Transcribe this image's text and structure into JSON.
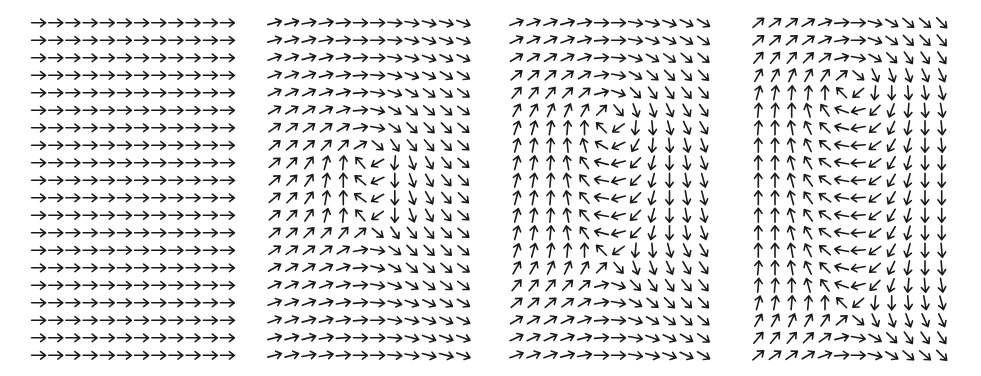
{
  "figure": {
    "arrow_color": "#1a1a1a",
    "background": "#ffffff",
    "rows": 20,
    "cols": 12
  },
  "panels": [
    {
      "id": "panel-1",
      "x": 30,
      "width": 206,
      "angles": [
        [
          0,
          0,
          0,
          0,
          0,
          0,
          0,
          0,
          0,
          0,
          0,
          0
        ],
        [
          0,
          0,
          0,
          0,
          0,
          0,
          0,
          0,
          0,
          0,
          0,
          0
        ],
        [
          0,
          0,
          0,
          0,
          0,
          0,
          0,
          0,
          0,
          0,
          0,
          0
        ],
        [
          0,
          0,
          0,
          0,
          0,
          0,
          0,
          0,
          0,
          0,
          0,
          0
        ],
        [
          0,
          0,
          0,
          0,
          0,
          0,
          0,
          0,
          0,
          0,
          0,
          0
        ],
        [
          0,
          0,
          0,
          0,
          0,
          0,
          0,
          0,
          0,
          0,
          0,
          0
        ],
        [
          0,
          0,
          0,
          0,
          0,
          0,
          0,
          0,
          0,
          0,
          0,
          0
        ],
        [
          0,
          0,
          0,
          0,
          0,
          0,
          0,
          0,
          0,
          0,
          0,
          0
        ],
        [
          0,
          0,
          0,
          0,
          0,
          0,
          0,
          0,
          0,
          0,
          0,
          0
        ],
        [
          0,
          0,
          0,
          0,
          0,
          0,
          0,
          0,
          0,
          0,
          0,
          0
        ],
        [
          0,
          0,
          0,
          0,
          0,
          0,
          0,
          0,
          0,
          0,
          0,
          0
        ],
        [
          0,
          0,
          0,
          0,
          0,
          0,
          0,
          0,
          0,
          0,
          0,
          0
        ],
        [
          0,
          0,
          0,
          0,
          0,
          0,
          0,
          0,
          0,
          0,
          0,
          0
        ],
        [
          0,
          0,
          0,
          0,
          0,
          0,
          0,
          0,
          0,
          0,
          0,
          0
        ],
        [
          0,
          0,
          0,
          0,
          0,
          0,
          0,
          0,
          0,
          0,
          0,
          0
        ],
        [
          0,
          0,
          0,
          0,
          0,
          0,
          0,
          0,
          0,
          0,
          0,
          0
        ],
        [
          0,
          0,
          0,
          0,
          0,
          0,
          0,
          0,
          0,
          0,
          0,
          0
        ],
        [
          0,
          0,
          0,
          0,
          0,
          0,
          0,
          0,
          0,
          0,
          0,
          0
        ],
        [
          0,
          0,
          0,
          0,
          0,
          0,
          0,
          0,
          0,
          0,
          0,
          0
        ],
        [
          0,
          0,
          0,
          0,
          0,
          0,
          0,
          0,
          0,
          0,
          0,
          0
        ]
      ]
    },
    {
      "id": "panel-2",
      "x": 266,
      "width": 206,
      "angles": [
        [
          15,
          15,
          10,
          10,
          5,
          0,
          0,
          -5,
          -10,
          -15,
          -15,
          -20
        ],
        [
          15,
          15,
          15,
          10,
          5,
          0,
          0,
          -5,
          -15,
          -20,
          -20,
          -20
        ],
        [
          20,
          20,
          15,
          15,
          10,
          5,
          0,
          -10,
          -15,
          -20,
          -25,
          -25
        ],
        [
          20,
          20,
          20,
          15,
          10,
          5,
          -5,
          -15,
          -20,
          -25,
          -30,
          -30
        ],
        [
          25,
          25,
          25,
          20,
          15,
          5,
          -10,
          -20,
          -30,
          -35,
          -35,
          -35
        ],
        [
          30,
          30,
          30,
          25,
          20,
          5,
          -15,
          -30,
          -40,
          -40,
          -40,
          -35
        ],
        [
          35,
          35,
          35,
          35,
          30,
          10,
          -10,
          -35,
          -45,
          -45,
          -45,
          -40
        ],
        [
          40,
          40,
          40,
          45,
          45,
          30,
          -40,
          -55,
          -50,
          -50,
          -45,
          -40
        ],
        [
          40,
          45,
          55,
          75,
          85,
          130,
          210,
          265,
          290,
          300,
          310,
          320
        ],
        [
          40,
          45,
          55,
          80,
          90,
          140,
          205,
          270,
          290,
          300,
          310,
          315
        ],
        [
          40,
          45,
          55,
          80,
          90,
          145,
          210,
          270,
          290,
          300,
          310,
          315
        ],
        [
          40,
          45,
          55,
          75,
          85,
          130,
          215,
          270,
          290,
          300,
          310,
          320
        ],
        [
          40,
          40,
          45,
          45,
          50,
          40,
          -40,
          -55,
          -50,
          -50,
          -45,
          -40
        ],
        [
          35,
          35,
          35,
          35,
          30,
          10,
          -10,
          -35,
          -45,
          -45,
          -45,
          -40
        ],
        [
          30,
          30,
          30,
          25,
          20,
          5,
          -15,
          -30,
          -40,
          -40,
          -40,
          -35
        ],
        [
          25,
          25,
          25,
          20,
          15,
          5,
          -10,
          -20,
          -30,
          -35,
          -35,
          -35
        ],
        [
          20,
          20,
          20,
          15,
          10,
          5,
          -5,
          -15,
          -20,
          -25,
          -30,
          -30
        ],
        [
          20,
          20,
          15,
          15,
          10,
          5,
          0,
          -10,
          -15,
          -20,
          -25,
          -25
        ],
        [
          15,
          15,
          15,
          10,
          5,
          0,
          0,
          -5,
          -15,
          -20,
          -20,
          -20
        ],
        [
          15,
          15,
          10,
          10,
          5,
          0,
          0,
          -5,
          -10,
          -15,
          -15,
          -20
        ]
      ]
    },
    {
      "id": "panel-3",
      "x": 508,
      "width": 204,
      "angles": [
        [
          20,
          20,
          20,
          15,
          10,
          0,
          0,
          -10,
          -15,
          -20,
          -25,
          -30
        ],
        [
          25,
          25,
          25,
          20,
          15,
          5,
          0,
          -10,
          -20,
          -25,
          -30,
          -35
        ],
        [
          30,
          30,
          30,
          25,
          20,
          5,
          -5,
          -20,
          -30,
          -35,
          -40,
          -40
        ],
        [
          40,
          40,
          40,
          35,
          30,
          10,
          -10,
          -30,
          -40,
          -45,
          -45,
          -45
        ],
        [
          50,
          50,
          50,
          45,
          40,
          15,
          -20,
          -45,
          -55,
          -55,
          -50,
          -50
        ],
        [
          60,
          60,
          65,
          65,
          60,
          45,
          -50,
          -70,
          -70,
          -65,
          -60,
          -55
        ],
        [
          70,
          75,
          80,
          85,
          90,
          135,
          215,
          265,
          275,
          285,
          295,
          300
        ],
        [
          75,
          80,
          85,
          95,
          105,
          150,
          205,
          240,
          265,
          275,
          285,
          290
        ],
        [
          75,
          80,
          85,
          100,
          125,
          165,
          195,
          225,
          255,
          270,
          280,
          290
        ],
        [
          75,
          80,
          85,
          100,
          130,
          170,
          195,
          225,
          255,
          270,
          280,
          285
        ],
        [
          75,
          80,
          85,
          100,
          130,
          170,
          195,
          225,
          255,
          270,
          280,
          285
        ],
        [
          75,
          80,
          85,
          100,
          130,
          170,
          195,
          225,
          255,
          270,
          280,
          285
        ],
        [
          75,
          80,
          85,
          100,
          125,
          165,
          195,
          225,
          255,
          270,
          280,
          290
        ],
        [
          70,
          75,
          80,
          85,
          90,
          135,
          215,
          265,
          275,
          285,
          295,
          300
        ],
        [
          60,
          60,
          65,
          65,
          60,
          45,
          -50,
          -70,
          -70,
          -65,
          -60,
          -55
        ],
        [
          50,
          50,
          50,
          45,
          40,
          15,
          -20,
          -45,
          -55,
          -55,
          -50,
          -50
        ],
        [
          40,
          40,
          40,
          35,
          30,
          10,
          -10,
          -30,
          -40,
          -45,
          -45,
          -45
        ],
        [
          30,
          30,
          30,
          25,
          20,
          5,
          -5,
          -20,
          -30,
          -35,
          -40,
          -40
        ],
        [
          25,
          25,
          25,
          20,
          15,
          5,
          0,
          -10,
          -20,
          -25,
          -30,
          -35
        ],
        [
          20,
          20,
          20,
          15,
          10,
          0,
          0,
          -10,
          -15,
          -20,
          -25,
          -30
        ]
      ]
    },
    {
      "id": "panel-4",
      "x": 750,
      "width": 200,
      "angles": [
        [
          40,
          35,
          35,
          30,
          20,
          5,
          0,
          -15,
          -30,
          -40,
          -40,
          -45
        ],
        [
          40,
          40,
          40,
          35,
          25,
          10,
          0,
          -20,
          -35,
          -45,
          -45,
          -50
        ],
        [
          50,
          50,
          50,
          45,
          35,
          15,
          -10,
          -30,
          -45,
          -55,
          -55,
          -55
        ],
        [
          60,
          60,
          65,
          60,
          55,
          40,
          -40,
          -65,
          -70,
          -70,
          -65,
          -65
        ],
        [
          75,
          80,
          85,
          85,
          90,
          135,
          220,
          265,
          270,
          275,
          280,
          285
        ],
        [
          85,
          85,
          90,
          105,
          125,
          160,
          195,
          225,
          250,
          265,
          275,
          280
        ],
        [
          85,
          90,
          100,
          115,
          135,
          165,
          190,
          220,
          245,
          260,
          270,
          275
        ],
        [
          90,
          90,
          100,
          115,
          140,
          170,
          185,
          215,
          240,
          255,
          270,
          275
        ],
        [
          90,
          90,
          105,
          120,
          145,
          170,
          185,
          215,
          240,
          255,
          270,
          270
        ],
        [
          90,
          90,
          105,
          125,
          145,
          170,
          185,
          215,
          240,
          255,
          270,
          270
        ],
        [
          90,
          90,
          105,
          125,
          145,
          170,
          185,
          215,
          240,
          255,
          270,
          270
        ],
        [
          90,
          90,
          105,
          125,
          145,
          170,
          185,
          215,
          240,
          255,
          270,
          270
        ],
        [
          90,
          90,
          105,
          120,
          145,
          170,
          185,
          215,
          240,
          255,
          270,
          270
        ],
        [
          90,
          90,
          100,
          115,
          140,
          170,
          185,
          215,
          240,
          255,
          270,
          275
        ],
        [
          85,
          90,
          100,
          115,
          135,
          165,
          190,
          220,
          245,
          260,
          270,
          275
        ],
        [
          85,
          85,
          90,
          105,
          125,
          160,
          195,
          225,
          250,
          265,
          275,
          280
        ],
        [
          75,
          80,
          85,
          85,
          90,
          135,
          220,
          265,
          270,
          275,
          280,
          285
        ],
        [
          60,
          60,
          65,
          60,
          55,
          40,
          -40,
          -65,
          -70,
          -70,
          -65,
          -65
        ],
        [
          50,
          50,
          50,
          45,
          35,
          15,
          -10,
          -30,
          -45,
          -55,
          -55,
          -55
        ],
        [
          40,
          35,
          35,
          30,
          20,
          5,
          0,
          -15,
          -30,
          -40,
          -40,
          -45
        ]
      ]
    }
  ]
}
